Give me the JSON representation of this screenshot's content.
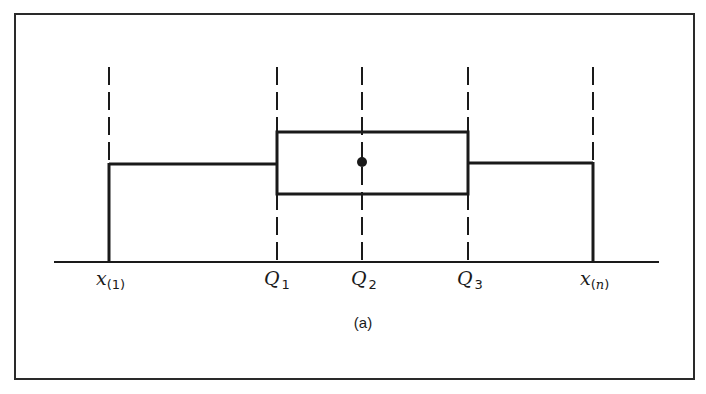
{
  "figure": {
    "caption": "(a)",
    "type": "schematic box plot"
  },
  "labels": {
    "x_min": {
      "main": "x",
      "open": "(",
      "sub": "1",
      "close": ")"
    },
    "q1": {
      "main": "Q",
      "sub": "1"
    },
    "q2": {
      "main": "Q",
      "sub": "2"
    },
    "q3": {
      "main": "Q",
      "sub": "3"
    },
    "x_max": {
      "main": "x",
      "open": "(",
      "sub": "n",
      "close": ")"
    }
  },
  "elements": {
    "whisker_left": "x(1) to Q1",
    "box": "Q1 to Q3",
    "median_marker": "dot at Q2",
    "whisker_right": "Q3 to x(n)"
  },
  "colors": {
    "ink": "#1a1a1a",
    "background": "#ffffff"
  }
}
